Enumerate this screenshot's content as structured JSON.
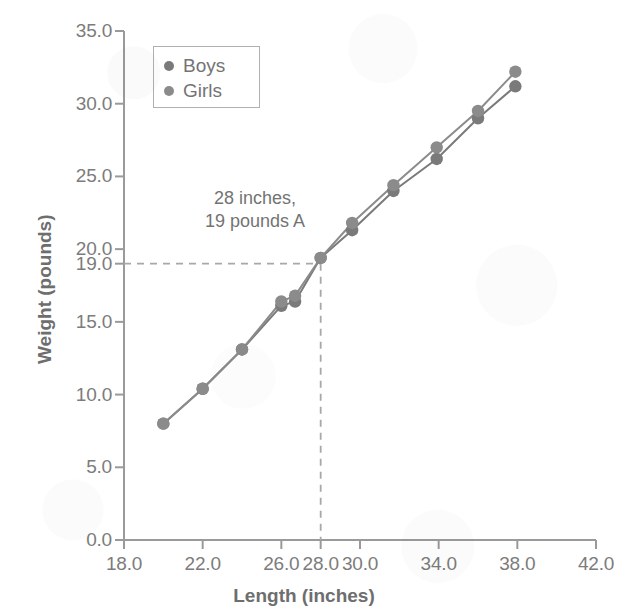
{
  "chart_data": {
    "type": "scatter",
    "title": "",
    "xlabel": "Length (inches)",
    "ylabel": "Weight (pounds)",
    "xlim": [
      18.0,
      42.0
    ],
    "ylim": [
      0.0,
      35.0
    ],
    "grid": false,
    "legend_position": "upper-left",
    "x_ticks": [
      "18.0",
      "22.0",
      "26.0",
      "28.0",
      "30.0",
      "34.0",
      "38.0",
      "42.0"
    ],
    "x_tick_values": [
      18.0,
      22.0,
      26.0,
      28.0,
      30.0,
      34.0,
      38.0,
      42.0
    ],
    "y_ticks": [
      "0.0",
      "5.0",
      "10.0",
      "15.0",
      "19.0",
      "20.0",
      "25.0",
      "30.0",
      "35.0"
    ],
    "y_tick_values": [
      0.0,
      5.0,
      10.0,
      15.0,
      19.0,
      20.0,
      25.0,
      30.0,
      35.0
    ],
    "series": [
      {
        "name": "Boys",
        "color": "#7a7a7a",
        "x": [
          20.0,
          22.0,
          24.0,
          26.0,
          26.7,
          28.0,
          29.6,
          31.7,
          33.9,
          36.0,
          37.9
        ],
        "values": [
          8.0,
          10.4,
          13.1,
          16.1,
          16.4,
          19.4,
          21.3,
          24.0,
          26.2,
          29.0,
          31.2
        ]
      },
      {
        "name": "Girls",
        "color": "#8b8b8b",
        "x": [
          20.0,
          22.0,
          24.0,
          26.0,
          26.7,
          28.0,
          29.6,
          31.7,
          33.9,
          36.0,
          37.9
        ],
        "values": [
          8.0,
          10.4,
          13.1,
          16.4,
          16.8,
          19.4,
          21.8,
          24.4,
          27.0,
          29.5,
          32.2
        ]
      }
    ],
    "annotations": [
      {
        "text_line_1": "28 inches,",
        "text_line_2": "19 pounds A",
        "point_x": 28.0,
        "point_y": 19.0,
        "guide_style": "dashed-crosshair"
      }
    ]
  },
  "legend": {
    "entries": [
      {
        "label": "Boys",
        "color": "#7a7a7a"
      },
      {
        "label": "Girls",
        "color": "#8b8b8b"
      }
    ]
  },
  "axes": {
    "x_title": "Length (inches)",
    "y_title": "Weight (pounds)"
  },
  "colors": {
    "axis": "#9a9a9a",
    "text": "#757575",
    "marker_boys": "#7a7a7a",
    "marker_girls": "#8b8b8b",
    "guide": "#a8a8a8",
    "background": "#ffffff"
  }
}
